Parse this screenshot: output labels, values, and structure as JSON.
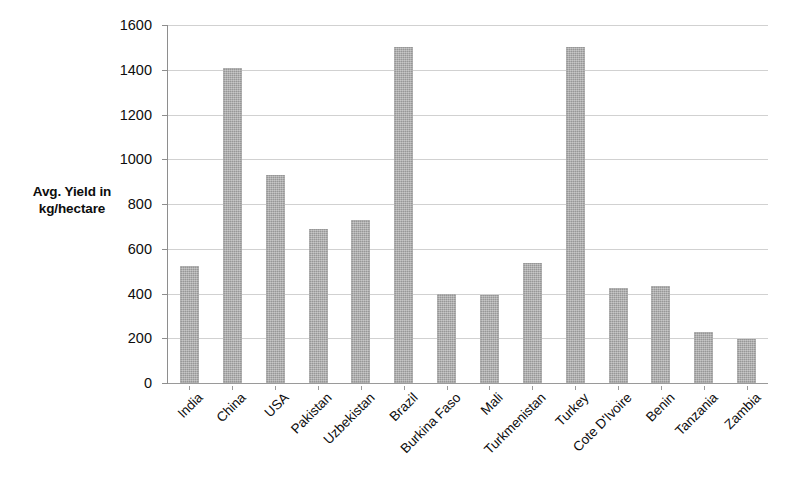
{
  "chart_data": {
    "type": "bar",
    "title": "",
    "xlabel": "",
    "ylabel": "Avg. Yield in kg/hectare",
    "ylabel_line1": "Avg. Yield in",
    "ylabel_line2": "kg/hectare",
    "ylim": [
      0,
      1600
    ],
    "y_tick_step": 200,
    "y_ticks": [
      0,
      200,
      400,
      600,
      800,
      1000,
      1200,
      1400,
      1600
    ],
    "y_tick_labels": [
      "0",
      "200",
      "400",
      "600",
      "800",
      "1000",
      "1200",
      "1400",
      "1600"
    ],
    "grid": true,
    "grid_axis": "y",
    "legend": false,
    "legend_position": "none",
    "bar_color": "#a9a9a9",
    "x_label_rotation": -45,
    "categories": [
      "India",
      "China",
      "USA",
      "Pakistan",
      "Uzbekistan",
      "Brazil",
      "Burkina Faso",
      "Mali",
      "Turkmenistan",
      "Turkey",
      "Cote D'Ivoire",
      "Benin",
      "Tanzania",
      "Zambia"
    ],
    "values": [
      525,
      1410,
      930,
      690,
      730,
      1500,
      400,
      395,
      535,
      1500,
      425,
      435,
      228,
      195
    ]
  }
}
